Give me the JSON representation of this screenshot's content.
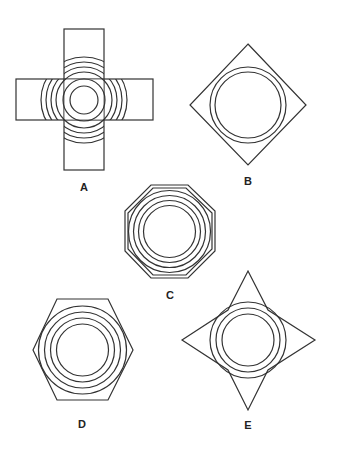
{
  "figure": {
    "background": "#ffffff",
    "stroke_color": "#333333",
    "options": [
      {
        "id": "A",
        "label": "A",
        "shape": "cross with concentric circles and arcs"
      },
      {
        "id": "B",
        "label": "B",
        "shape": "diamond with two concentric circles"
      },
      {
        "id": "C",
        "label": "C",
        "shape": "octagon with concentric rings"
      },
      {
        "id": "D",
        "label": "D",
        "shape": "hexagon with concentric circles"
      },
      {
        "id": "E",
        "label": "E",
        "shape": "four-pointed star with concentric circles"
      }
    ]
  }
}
